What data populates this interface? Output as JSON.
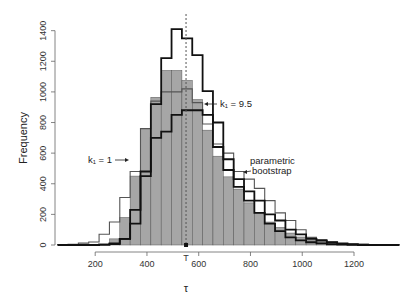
{
  "chart_data": {
    "type": "bar",
    "subtype": "histogram-with-step-outlines",
    "title": "",
    "xlabel": "τ",
    "ylabel": "Frequency",
    "xlim": [
      40,
      1350
    ],
    "ylim": [
      0,
      1400
    ],
    "xticks": [
      200,
      400,
      600,
      800,
      1000,
      1200
    ],
    "yticks": [
      0,
      200,
      400,
      600,
      800,
      1000,
      1200,
      1400
    ],
    "grid": false,
    "legend": "none (inline annotations)",
    "bin_width": 40,
    "bin_start": 55,
    "series": [
      {
        "name": "observed (histogram)",
        "style": "filled-gray",
        "values": [
          0,
          0,
          0,
          0,
          5,
          40,
          180,
          450,
          760,
          965,
          1140,
          1140,
          1075,
          950,
          750,
          580,
          445,
          365,
          275,
          210,
          150,
          115,
          78,
          52,
          33,
          20,
          15,
          8,
          4,
          2,
          0,
          0,
          0
        ]
      },
      {
        "name": "parametric bootstrap",
        "style": "thin-gray-step",
        "values": [
          3,
          5,
          12,
          20,
          70,
          150,
          310,
          480,
          760,
          940,
          1000,
          1000,
          1020,
          930,
          790,
          660,
          600,
          480,
          430,
          370,
          290,
          210,
          160,
          100,
          50,
          35,
          20,
          10,
          6,
          4,
          3,
          2,
          2
        ]
      },
      {
        "name": "k1 = 9.5",
        "style": "thick-black-step-upper",
        "values": [
          0,
          0,
          0,
          0,
          2,
          10,
          40,
          140,
          480,
          920,
          1220,
          1410,
          1350,
          1240,
          1005,
          800,
          490,
          380,
          290,
          210,
          140,
          90,
          50,
          30,
          18,
          10,
          5,
          3,
          1,
          0,
          0,
          0,
          0
        ]
      },
      {
        "name": "k1 = 1",
        "style": "thick-black-step-lower",
        "values": [
          0,
          0,
          0,
          0,
          2,
          6,
          40,
          230,
          450,
          700,
          740,
          850,
          880,
          880,
          850,
          640,
          560,
          430,
          350,
          290,
          200,
          160,
          100,
          70,
          40,
          28,
          18,
          10,
          5,
          3,
          1,
          0,
          0
        ]
      }
    ],
    "annotations": [
      {
        "text": "k₁ = 1",
        "arrow_to": "k1 = 1 series near τ≈330"
      },
      {
        "text": "k₁ = 9.5",
        "arrow_to": "k1 = 9.5 series near τ≈580"
      },
      {
        "text": "parametric bootstrap",
        "arrow_to": "parametric bootstrap series near τ≈820"
      },
      {
        "text": "T",
        "marker_at": 551,
        "note": "vertical dotted line at observed statistic T"
      }
    ],
    "reference_line": {
      "x": 551,
      "style": "dotted",
      "label": "T"
    }
  },
  "labels": {
    "ylabel": "Frequency",
    "xlabel": "τ",
    "t_marker": "T",
    "k1_low": "k₁ = 1",
    "k1_high": "k₁ = 9.5",
    "param_line1": "parametric",
    "param_line2": "bootstrap"
  },
  "colors": {
    "bar_fill": "#a6a6a6",
    "bar_edge": "#555555",
    "bootstrap_line": "#555555",
    "k_lines": "#111111",
    "axis": "#666666"
  }
}
